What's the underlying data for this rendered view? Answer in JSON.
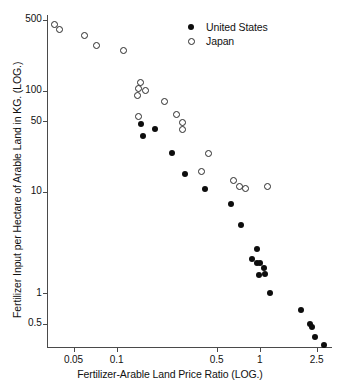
{
  "chart_data": {
    "type": "scatter",
    "title": "",
    "xlabel": "Fertilizer-Arable Land Price Ratio (LOG.)",
    "ylabel": "Fertilizer Input per Hectare of Arable Land in KG.  (LOG.)",
    "xscale": "log",
    "yscale": "log",
    "xlim": [
      0.033,
      3.2
    ],
    "ylim": [
      0.3,
      560
    ],
    "grid": false,
    "legend_position": "top-right",
    "xticks": [
      0.05,
      0.1,
      0.5,
      1,
      2.5
    ],
    "xticklabels": [
      "0.05",
      "0.1",
      "0.5",
      "1",
      "2.5"
    ],
    "yticks": [
      500,
      100,
      50,
      10,
      1,
      0.5
    ],
    "yticklabels": [
      "500",
      "100",
      "50",
      "10",
      "1",
      "0.5"
    ],
    "series": [
      {
        "name": "United States",
        "marker": "filled-circle",
        "color": "#0d0d0d",
        "points": [
          [
            0.148,
            47.0
          ],
          [
            0.152,
            36.0
          ],
          [
            0.185,
            42.0
          ],
          [
            0.245,
            24.0
          ],
          [
            0.3,
            15.0
          ],
          [
            0.415,
            10.6
          ],
          [
            0.63,
            7.6
          ],
          [
            0.745,
            4.7
          ],
          [
            0.88,
            2.15
          ],
          [
            0.955,
            2.7
          ],
          [
            0.96,
            2.0
          ],
          [
            0.99,
            1.5
          ],
          [
            1.01,
            2.0
          ],
          [
            1.07,
            1.75
          ],
          [
            1.085,
            1.55
          ],
          [
            1.18,
            1.0
          ],
          [
            1.95,
            0.68
          ],
          [
            2.23,
            0.5
          ],
          [
            2.33,
            0.46
          ],
          [
            2.44,
            0.37
          ],
          [
            2.82,
            0.31
          ]
        ]
      },
      {
        "name": "Japan",
        "marker": "open-circle",
        "color": "#2a2a2a",
        "points": [
          [
            0.037,
            450.0
          ],
          [
            0.04,
            400.0
          ],
          [
            0.06,
            350.0
          ],
          [
            0.072,
            280.0
          ],
          [
            0.112,
            250.0
          ],
          [
            0.146,
            120.0
          ],
          [
            0.142,
            105.0
          ],
          [
            0.14,
            90.0
          ],
          [
            0.16,
            100.0
          ],
          [
            0.143,
            55.0
          ],
          [
            0.215,
            78.0
          ],
          [
            0.262,
            58.0
          ],
          [
            0.29,
            49.0
          ],
          [
            0.288,
            41.0
          ],
          [
            0.44,
            24.0
          ],
          [
            0.39,
            16.0
          ],
          [
            0.66,
            13.0
          ],
          [
            0.72,
            11.2
          ],
          [
            0.79,
            10.8
          ],
          [
            1.13,
            11.3
          ]
        ]
      }
    ]
  },
  "legend": {
    "items": [
      {
        "label": "United States",
        "marker": "filled-circle"
      },
      {
        "label": "Japan",
        "marker": "open-circle"
      }
    ]
  }
}
